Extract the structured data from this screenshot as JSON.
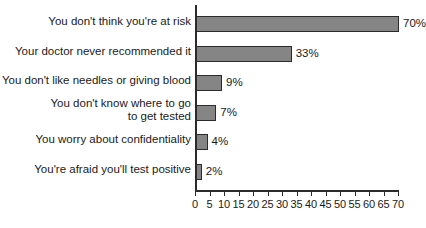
{
  "chart_data": {
    "type": "bar",
    "orientation": "horizontal",
    "title": "",
    "subtitle": "",
    "xlabel": "",
    "ylabel": "",
    "xlim": [
      0,
      70
    ],
    "grid": false,
    "legend": false,
    "value_suffix": "%",
    "categories": [
      "You don't think you're at risk",
      "Your doctor never recommended it",
      "You don't like needles or giving blood",
      "You don't know where to go\nto get tested",
      "You worry about confidentiality",
      "You're afraid you'll test positive"
    ],
    "values": [
      70,
      33,
      9,
      7,
      4,
      2
    ],
    "value_labels": [
      "70%",
      "33%",
      "9%",
      "7%",
      "4%",
      "2%"
    ],
    "xticks": [
      0,
      5,
      10,
      15,
      20,
      25,
      30,
      35,
      40,
      45,
      50,
      55,
      60,
      65,
      70
    ],
    "xtick_labels": [
      "0",
      "5",
      "10",
      "15",
      "20",
      "25",
      "30",
      "35",
      "40",
      "45",
      "50",
      "55",
      "60",
      "65",
      "70"
    ],
    "colors": {
      "bar_fill": "#858585",
      "bar_stroke": "#2b2b2b",
      "axis": "#2b2b2b",
      "text": "#1a1a1a",
      "background": "#ffffff"
    }
  }
}
